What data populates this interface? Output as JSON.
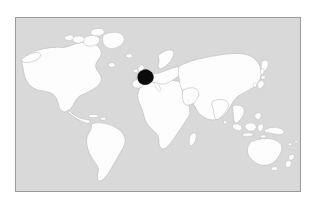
{
  "figure": {
    "kind": "world-locator-map",
    "projection": "equirectangular",
    "panel": {
      "background_color": "#d9d9d9",
      "border_color": "#9a9a9a",
      "left": 15,
      "top": 17,
      "width": 286,
      "height": 175
    },
    "outer_margin_color": "#ffffff"
  },
  "legend": {
    "land_fill_color": "#fdfdfd",
    "land_outline_color": "#a9a9a9",
    "ocean_fill_color": "#d9d9d9",
    "highlight_fill_color": "#0a0a0a"
  },
  "highlight": {
    "name": "France",
    "region": "Western Europe",
    "state": "selected",
    "fill_color": "#0a0a0a",
    "center_x": 156,
    "center_y": 72
  },
  "landmasses": [
    {
      "name": "North America",
      "highlighted": false
    },
    {
      "name": "Greenland and Canadian Arctic Archipelago",
      "highlighted": false
    },
    {
      "name": "South America",
      "highlighted": false
    },
    {
      "name": "Africa",
      "highlighted": false
    },
    {
      "name": "Europe",
      "highlighted": false
    },
    {
      "name": "Asia",
      "highlighted": false
    },
    {
      "name": "Australia",
      "highlighted": false
    },
    {
      "name": "New Guinea",
      "highlighted": false
    },
    {
      "name": "New Zealand",
      "highlighted": false
    },
    {
      "name": "Japan",
      "highlighted": false
    },
    {
      "name": "British Isles",
      "highlighted": false
    },
    {
      "name": "Madagascar",
      "highlighted": false
    },
    {
      "name": "Indonesia",
      "highlighted": false
    },
    {
      "name": "Iceland",
      "highlighted": false
    },
    {
      "name": "France",
      "highlighted": true
    }
  ],
  "labels": {
    "has_text_labels": false,
    "has_title": false,
    "has_graticule": false
  }
}
